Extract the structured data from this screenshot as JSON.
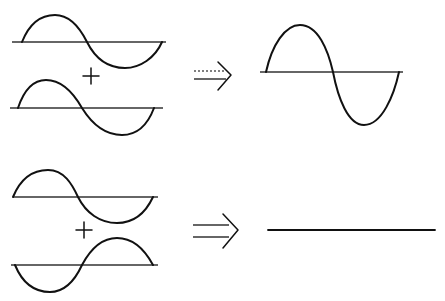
{
  "figure": {
    "description": "Wave superposition: constructive and destructive interference",
    "colors": {
      "ink": "#111111",
      "axis": "#333333",
      "background": "#ffffff"
    },
    "rows": [
      {
        "name": "constructive-interference",
        "inputs": [
          {
            "label": "wave A",
            "phase": "in-phase",
            "amplitude": 1
          },
          {
            "label": "wave B",
            "phase": "in-phase",
            "amplitude": 1
          }
        ],
        "operator": "+",
        "arrow": "⇒",
        "result": {
          "label": "resultant wave",
          "amplitude": 2
        }
      },
      {
        "name": "destructive-interference",
        "inputs": [
          {
            "label": "wave A",
            "phase": "0°",
            "amplitude": 1
          },
          {
            "label": "wave B",
            "phase": "180° (inverted)",
            "amplitude": 1
          }
        ],
        "operator": "+",
        "arrow": "⇒",
        "result": {
          "label": "flat line (zero amplitude)",
          "amplitude": 0
        }
      }
    ]
  }
}
